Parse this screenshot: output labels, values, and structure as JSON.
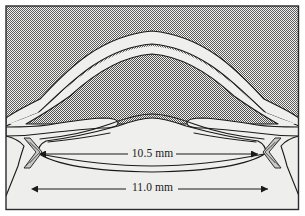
{
  "figure": {
    "background_color": "#eeeeec",
    "tissue_fill_color": "#efefed",
    "stipple_color": "#6f6f6f",
    "outline_color": "#1a1a1a",
    "frame_border_color": "#2b2b2b"
  },
  "annotations": {
    "equatorial_diameter": {
      "label": "10.5 mm",
      "value": 10.5,
      "unit": "mm",
      "arrow_style": "double-headed",
      "position": "upper"
    },
    "overall_diameter": {
      "label": "11.0 mm",
      "value": 11.0,
      "unit": "mm",
      "arrow_style": "double-headed",
      "position": "lower"
    }
  },
  "structures": [
    {
      "name": "cornea",
      "shading": "light"
    },
    {
      "name": "anterior-chamber",
      "shading": "stippled"
    },
    {
      "name": "iris",
      "shading": "light"
    },
    {
      "name": "lens-body",
      "shading": "light"
    },
    {
      "name": "zonule-fibers-left",
      "shading": "light"
    },
    {
      "name": "zonule-fibers-right",
      "shading": "light"
    },
    {
      "name": "ciliary-body-left",
      "shading": "light"
    },
    {
      "name": "ciliary-body-right",
      "shading": "light"
    }
  ]
}
